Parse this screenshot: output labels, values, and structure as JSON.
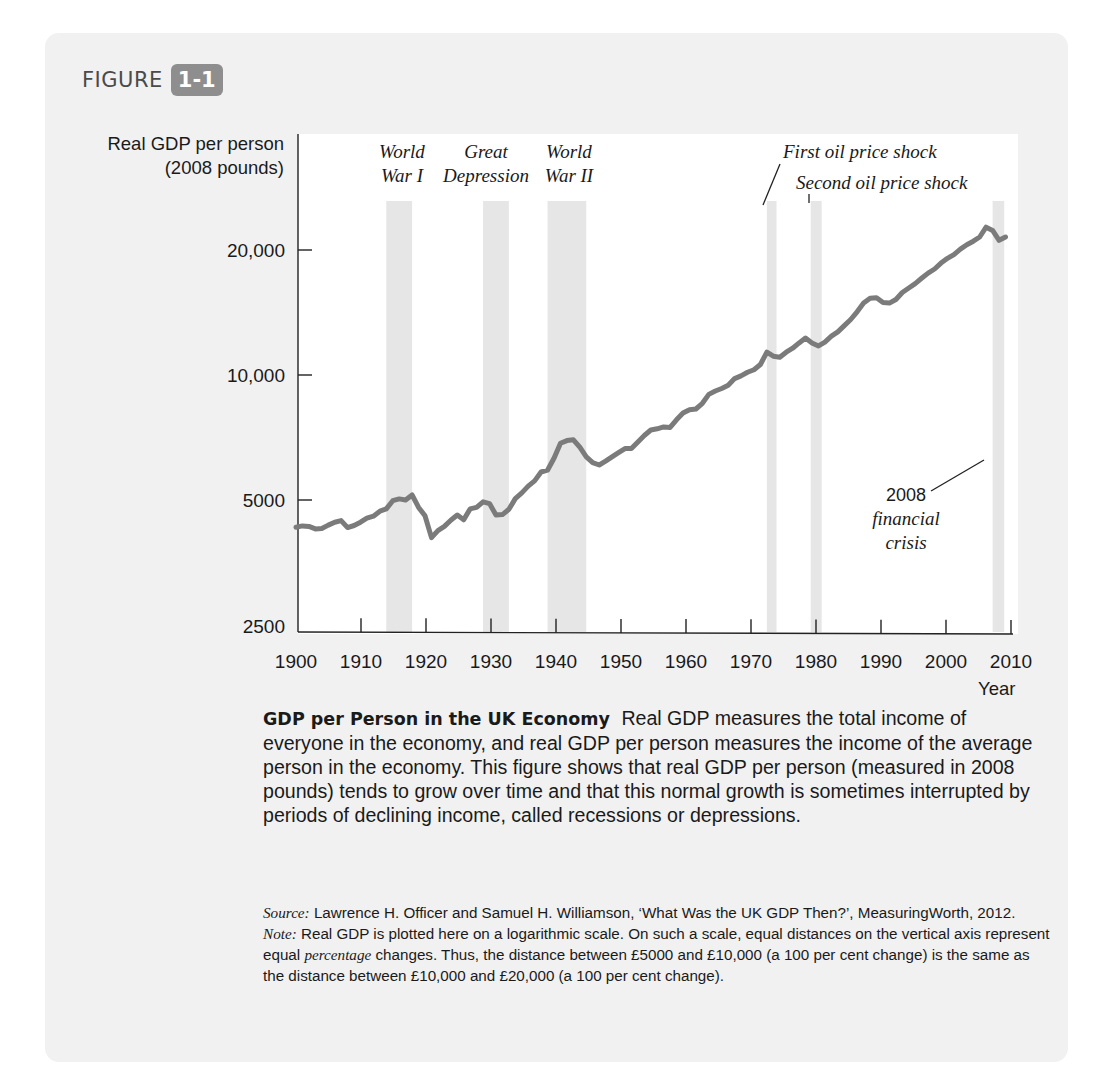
{
  "figure": {
    "label": "FIGURE",
    "number": "1-1"
  },
  "chart_data": {
    "type": "line",
    "title": "GDP per Person in the UK Economy",
    "ylabel": "Real GDP per person (2008 pounds)",
    "ylabel_lines": [
      "Real GDP per person",
      "(2008 pounds)"
    ],
    "xlabel": "Year",
    "yscale": "log",
    "ylim": [
      2500,
      26000
    ],
    "xlim": [
      1900,
      2012
    ],
    "grid": false,
    "y_ticks": [
      {
        "value": 2500,
        "label": "2500"
      },
      {
        "value": 5000,
        "label": "5000"
      },
      {
        "value": 10000,
        "label": "10,000"
      },
      {
        "value": 20000,
        "label": "20,000"
      }
    ],
    "x_ticks": [
      {
        "value": 1900,
        "label": "1900"
      },
      {
        "value": 1910,
        "label": "1910"
      },
      {
        "value": 1920,
        "label": "1920"
      },
      {
        "value": 1930,
        "label": "1930"
      },
      {
        "value": 1940,
        "label": "1940"
      },
      {
        "value": 1950,
        "label": "1950"
      },
      {
        "value": 1960,
        "label": "1960"
      },
      {
        "value": 1970,
        "label": "1970"
      },
      {
        "value": 1980,
        "label": "1980"
      },
      {
        "value": 1990,
        "label": "1990"
      },
      {
        "value": 2000,
        "label": "2000"
      },
      {
        "value": 2010,
        "label": "2010"
      }
    ],
    "series": [
      {
        "name": "Real GDP per person",
        "color": "#7b7b7b",
        "points": [
          [
            1900,
            4300
          ],
          [
            1901,
            4330
          ],
          [
            1902,
            4320
          ],
          [
            1903,
            4260
          ],
          [
            1904,
            4270
          ],
          [
            1905,
            4350
          ],
          [
            1906,
            4420
          ],
          [
            1907,
            4460
          ],
          [
            1908,
            4290
          ],
          [
            1909,
            4340
          ],
          [
            1910,
            4420
          ],
          [
            1911,
            4520
          ],
          [
            1912,
            4570
          ],
          [
            1913,
            4700
          ],
          [
            1914,
            4760
          ],
          [
            1915,
            4980
          ],
          [
            1916,
            5030
          ],
          [
            1917,
            5000
          ],
          [
            1918,
            5140
          ],
          [
            1919,
            4800
          ],
          [
            1920,
            4580
          ],
          [
            1921,
            4060
          ],
          [
            1922,
            4220
          ],
          [
            1923,
            4320
          ],
          [
            1924,
            4470
          ],
          [
            1925,
            4600
          ],
          [
            1926,
            4480
          ],
          [
            1927,
            4760
          ],
          [
            1928,
            4800
          ],
          [
            1929,
            4950
          ],
          [
            1930,
            4900
          ],
          [
            1931,
            4600
          ],
          [
            1932,
            4610
          ],
          [
            1933,
            4750
          ],
          [
            1934,
            5040
          ],
          [
            1935,
            5200
          ],
          [
            1936,
            5400
          ],
          [
            1937,
            5560
          ],
          [
            1938,
            5840
          ],
          [
            1939,
            5900
          ],
          [
            1940,
            6300
          ],
          [
            1941,
            6850
          ],
          [
            1942,
            6950
          ],
          [
            1943,
            6980
          ],
          [
            1944,
            6700
          ],
          [
            1945,
            6350
          ],
          [
            1946,
            6150
          ],
          [
            1947,
            6070
          ],
          [
            1948,
            6200
          ],
          [
            1949,
            6350
          ],
          [
            1950,
            6500
          ],
          [
            1951,
            6650
          ],
          [
            1952,
            6650
          ],
          [
            1953,
            6900
          ],
          [
            1954,
            7150
          ],
          [
            1955,
            7370
          ],
          [
            1956,
            7420
          ],
          [
            1957,
            7500
          ],
          [
            1958,
            7480
          ],
          [
            1959,
            7800
          ],
          [
            1960,
            8100
          ],
          [
            1961,
            8250
          ],
          [
            1962,
            8280
          ],
          [
            1963,
            8550
          ],
          [
            1964,
            8980
          ],
          [
            1965,
            9150
          ],
          [
            1966,
            9280
          ],
          [
            1967,
            9450
          ],
          [
            1968,
            9800
          ],
          [
            1969,
            9950
          ],
          [
            1970,
            10150
          ],
          [
            1971,
            10300
          ],
          [
            1972,
            10600
          ],
          [
            1973,
            11350
          ],
          [
            1974,
            11100
          ],
          [
            1975,
            11040
          ],
          [
            1976,
            11350
          ],
          [
            1977,
            11600
          ],
          [
            1978,
            11950
          ],
          [
            1979,
            12270
          ],
          [
            1980,
            11950
          ],
          [
            1981,
            11750
          ],
          [
            1982,
            12000
          ],
          [
            1983,
            12400
          ],
          [
            1984,
            12700
          ],
          [
            1985,
            13150
          ],
          [
            1986,
            13600
          ],
          [
            1987,
            14200
          ],
          [
            1988,
            14900
          ],
          [
            1989,
            15300
          ],
          [
            1990,
            15350
          ],
          [
            1991,
            14950
          ],
          [
            1992,
            14900
          ],
          [
            1993,
            15200
          ],
          [
            1994,
            15800
          ],
          [
            1995,
            16200
          ],
          [
            1996,
            16600
          ],
          [
            1997,
            17100
          ],
          [
            1998,
            17600
          ],
          [
            1999,
            18000
          ],
          [
            2000,
            18600
          ],
          [
            2001,
            19100
          ],
          [
            2002,
            19500
          ],
          [
            2003,
            20100
          ],
          [
            2004,
            20600
          ],
          [
            2005,
            21000
          ],
          [
            2006,
            21500
          ],
          [
            2007,
            22700
          ],
          [
            2008,
            22300
          ],
          [
            2009,
            21100
          ],
          [
            2010,
            21500
          ]
        ]
      }
    ],
    "shaded_periods": [
      {
        "name": "World War I",
        "start": 1914,
        "end": 1918,
        "label_lines": [
          "World",
          "War I"
        ]
      },
      {
        "name": "Great Depression",
        "start": 1929,
        "end": 1933,
        "label_lines": [
          "Great",
          "Depression"
        ]
      },
      {
        "name": "World War II",
        "start": 1939,
        "end": 1945,
        "label_lines": [
          "World",
          "War II"
        ]
      },
      {
        "name": "First oil price shock",
        "start": 1973,
        "end": 1974.5,
        "label_lines": [
          "First oil price shock"
        ]
      },
      {
        "name": "Second oil price shock",
        "start": 1979.8,
        "end": 1981.5,
        "label_lines": [
          "Second oil price shock"
        ]
      },
      {
        "name": "2008 financial crisis",
        "start": 2008,
        "end": 2009.8,
        "label_lines": [
          "2008",
          "financial",
          "crisis"
        ]
      }
    ],
    "band_color": "#e6e6e6",
    "axis_color": "#222222"
  },
  "caption": {
    "title": "GDP per Person in the UK Economy",
    "body": "Real GDP measures the total income of everyone in the economy, and real GDP per person measures the income of the average person in the economy. This figure shows that real GDP per person (measured in 2008 pounds) tends to grow over time and that this normal growth is sometimes interrupted by periods of declining income, called recessions or depressions."
  },
  "notes": {
    "source_label": "Source:",
    "source_text": "Lawrence H. Officer and Samuel H. Williamson, ‘What Was the UK GDP Then?’, MeasuringWorth, 2012.",
    "note_label": "Note:",
    "note_text_1": "Real GDP is plotted here on a logarithmic scale. On such a scale, equal distances on the vertical axis represent equal ",
    "note_emph": "percentage",
    "note_text_2": " changes. Thus, the distance between £5000 and £10,000 (a 100 per cent change) is the same as the distance between £10,000 and £20,000 (a 100 per cent change)."
  }
}
